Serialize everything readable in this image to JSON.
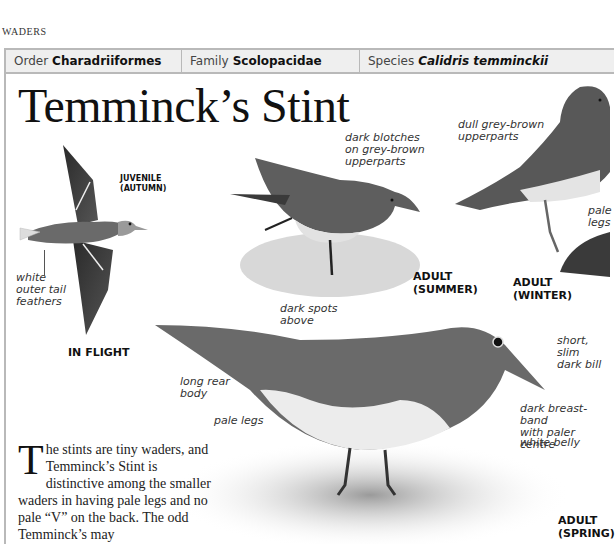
{
  "header": {
    "section": "WADERS"
  },
  "taxonomy": {
    "order_label": "Order",
    "order_value": "Charadriiformes",
    "family_label": "Family",
    "family_value": "Scolopacidae",
    "species_label": "Species",
    "species_value": "Calidris temminckii"
  },
  "title": "Temminck’s Stint",
  "illustrations": {
    "in_flight": {
      "caption": "IN FLIGHT",
      "sub_caption_1": "JUVENILE",
      "sub_caption_2": "(AUTUMN)",
      "annotations": [
        "white",
        "outer tail",
        "feathers"
      ]
    },
    "adult_summer": {
      "caption_1": "ADULT",
      "caption_2": "(SUMMER)",
      "annotations": [
        "dark blotches",
        "on grey-brown",
        "upperparts"
      ]
    },
    "adult_winter": {
      "caption": "ADULT (WINTER)",
      "annotations": [
        "dull grey-brown",
        "upperparts"
      ],
      "legs_annotation": [
        "pale",
        "legs"
      ]
    },
    "adult_spring": {
      "caption_1": "ADULT",
      "caption_2": "(SPRING)",
      "annotations": {
        "dark_spots": [
          "dark spots",
          "above"
        ],
        "long_rear": [
          "long rear",
          "body"
        ],
        "pale_legs": "pale legs",
        "bill": [
          "short, slim",
          "dark bill"
        ],
        "breast": [
          "dark breast-band",
          "with paler centre"
        ],
        "belly": "white belly"
      }
    }
  },
  "body": {
    "dropcap": "T",
    "text": "he stints are tiny waders, and Temminck’s Stint is distinctive among the smaller waders in having pale legs and no pale “V” on the back. The odd Temminck’s may"
  },
  "colors": {
    "rule": "#b9b9b9",
    "bar_bg": "#efefef"
  }
}
